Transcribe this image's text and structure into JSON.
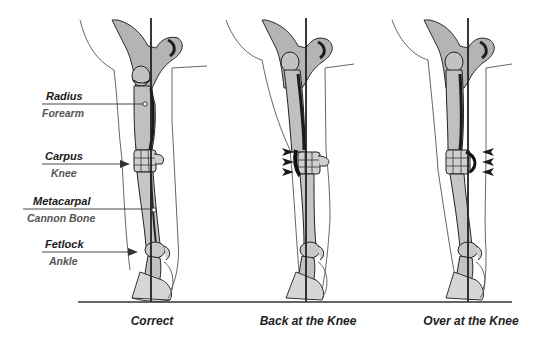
{
  "diagram": {
    "colors": {
      "bone_fill": "#bdbdbd",
      "bone_dark": "#3a3a3a",
      "outline": "#444444",
      "plumb_line": "#222222",
      "ground": "#333333",
      "text_main": "#1a1a1a",
      "text_sub": "#555555"
    },
    "anatomy_labels": [
      {
        "term": "Radius",
        "common": "Forearm",
        "pointer": "dot"
      },
      {
        "term": "Carpus",
        "common": "Knee",
        "pointer": "arrow"
      },
      {
        "term": "Metacarpal",
        "common": "Cannon Bone",
        "pointer": "dot"
      },
      {
        "term": "Fetlock",
        "common": "Ankle",
        "pointer": "arrow"
      }
    ],
    "panels": [
      {
        "caption": "Correct",
        "knee_marker": "none"
      },
      {
        "caption": "Back at the Knee",
        "knee_marker": "chevrons-left"
      },
      {
        "caption": "Over at the Knee",
        "knee_marker": "chevrons-right"
      }
    ]
  }
}
